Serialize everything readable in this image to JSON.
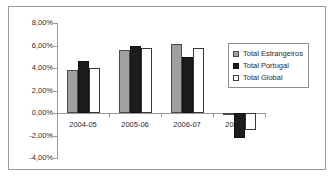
{
  "chart_data": {
    "type": "bar",
    "title": "",
    "xlabel": "",
    "ylabel": "",
    "categories": [
      "2004-05",
      "2005-06",
      "2006-07",
      "2007-08"
    ],
    "series": [
      {
        "name": "Total Estrangeiros",
        "color": "#a0a0a0",
        "values": [
          3.8,
          5.6,
          6.1,
          -0.15
        ]
      },
      {
        "name": "Total Portugal",
        "color": "#1c1c1c",
        "values": [
          4.6,
          6.0,
          4.95,
          -2.2
        ]
      },
      {
        "name": "Total Global",
        "color": "#ffffff",
        "values": [
          4.0,
          5.75,
          5.75,
          -1.5
        ]
      }
    ],
    "ylim": [
      -4.0,
      8.0
    ],
    "ytick_labels": [
      "8,00%",
      "6,00%",
      "4,00%",
      "2,00%",
      "0,00%",
      "-2,00%",
      "-4,00%"
    ],
    "ytick_values": [
      8.0,
      6.0,
      4.0,
      2.0,
      0.0,
      -2.0,
      -4.0
    ],
    "grid": false,
    "legend_position": "right-top",
    "value_unit": "%"
  }
}
